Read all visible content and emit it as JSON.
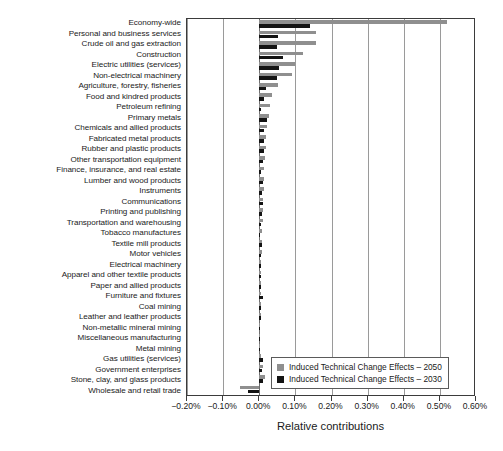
{
  "chart_data": {
    "type": "bar",
    "orientation": "horizontal",
    "title": "",
    "xlabel": "Relative contributions",
    "ylabel": "",
    "xlim": [
      -0.2,
      0.6
    ],
    "xticks": [
      -0.2,
      -0.1,
      0.0,
      0.1,
      0.2,
      0.3,
      0.4,
      0.5,
      0.6
    ],
    "xtick_labels": [
      "−0.20%",
      "−0.10%",
      "0.00%",
      "0.10%",
      "0.20%",
      "0.30%",
      "0.40%",
      "0.50%",
      "0.60%"
    ],
    "grid": true,
    "grid_axis": "x",
    "legend_position": "lower right",
    "categories": [
      "Economy-wide",
      "Personal and business services",
      "Crude oil and gas extraction",
      "Construction",
      "Electric utilities (services)",
      "Non-electrical machinery",
      "Agriculture, forestry, fisheries",
      "Food and kindred products",
      "Petroleum refining",
      "Primary metals",
      "Chemicals and allied products",
      "Fabricated metal products",
      "Rubber and plastic products",
      "Other transportation equipment",
      "Finance, insurance, and real estate",
      "Lumber and wood products",
      "Instruments",
      "Communications",
      "Printing and publishing",
      "Transportation and warehousing",
      "Tobacco manufactures",
      "Textile mill products",
      "Motor vehicles",
      "Electrical machinery",
      "Apparel and other textile products",
      "Paper and allied products",
      "Furniture and fixtures",
      "Coal mining",
      "Leather and leather products",
      "Non-metallic mineral mining",
      "Miscellaneous manufacturing",
      "Metal mining",
      "Gas utilities (services)",
      "Government enterprises",
      "Stone, clay, and glass products",
      "Wholesale and retail trade"
    ],
    "series": [
      {
        "name": "Induced Technical Change Effects – 2050",
        "color": "#8f8f8f",
        "values": [
          0.52,
          0.158,
          0.158,
          0.122,
          0.098,
          0.092,
          0.052,
          0.034,
          0.03,
          0.026,
          0.022,
          0.02,
          0.018,
          0.016,
          0.014,
          0.013,
          0.012,
          0.011,
          0.01,
          0.009,
          0.008,
          0.008,
          0.007,
          0.006,
          0.006,
          0.005,
          0.005,
          0.004,
          0.004,
          0.003,
          0.003,
          0.003,
          0.006,
          0.01,
          0.016,
          -0.052
        ]
      },
      {
        "name": "Induced Technical Change Effects – 2030",
        "color": "#141414",
        "values": [
          0.14,
          0.052,
          0.05,
          0.066,
          0.054,
          0.05,
          0.02,
          0.012,
          0.006,
          0.022,
          0.012,
          0.014,
          0.012,
          0.01,
          0.004,
          0.009,
          0.008,
          0.01,
          0.008,
          0.006,
          0.003,
          0.008,
          0.006,
          0.004,
          0.004,
          0.006,
          0.009,
          0.005,
          0.004,
          0.003,
          0.003,
          0.002,
          0.01,
          0.008,
          0.009,
          -0.031
        ]
      }
    ]
  },
  "legend": {
    "items": [
      {
        "label": "Induced Technical Change Effects – 2050",
        "color": "#8f8f8f"
      },
      {
        "label": "Induced Technical Change Effects – 2030",
        "color": "#141414"
      }
    ]
  }
}
